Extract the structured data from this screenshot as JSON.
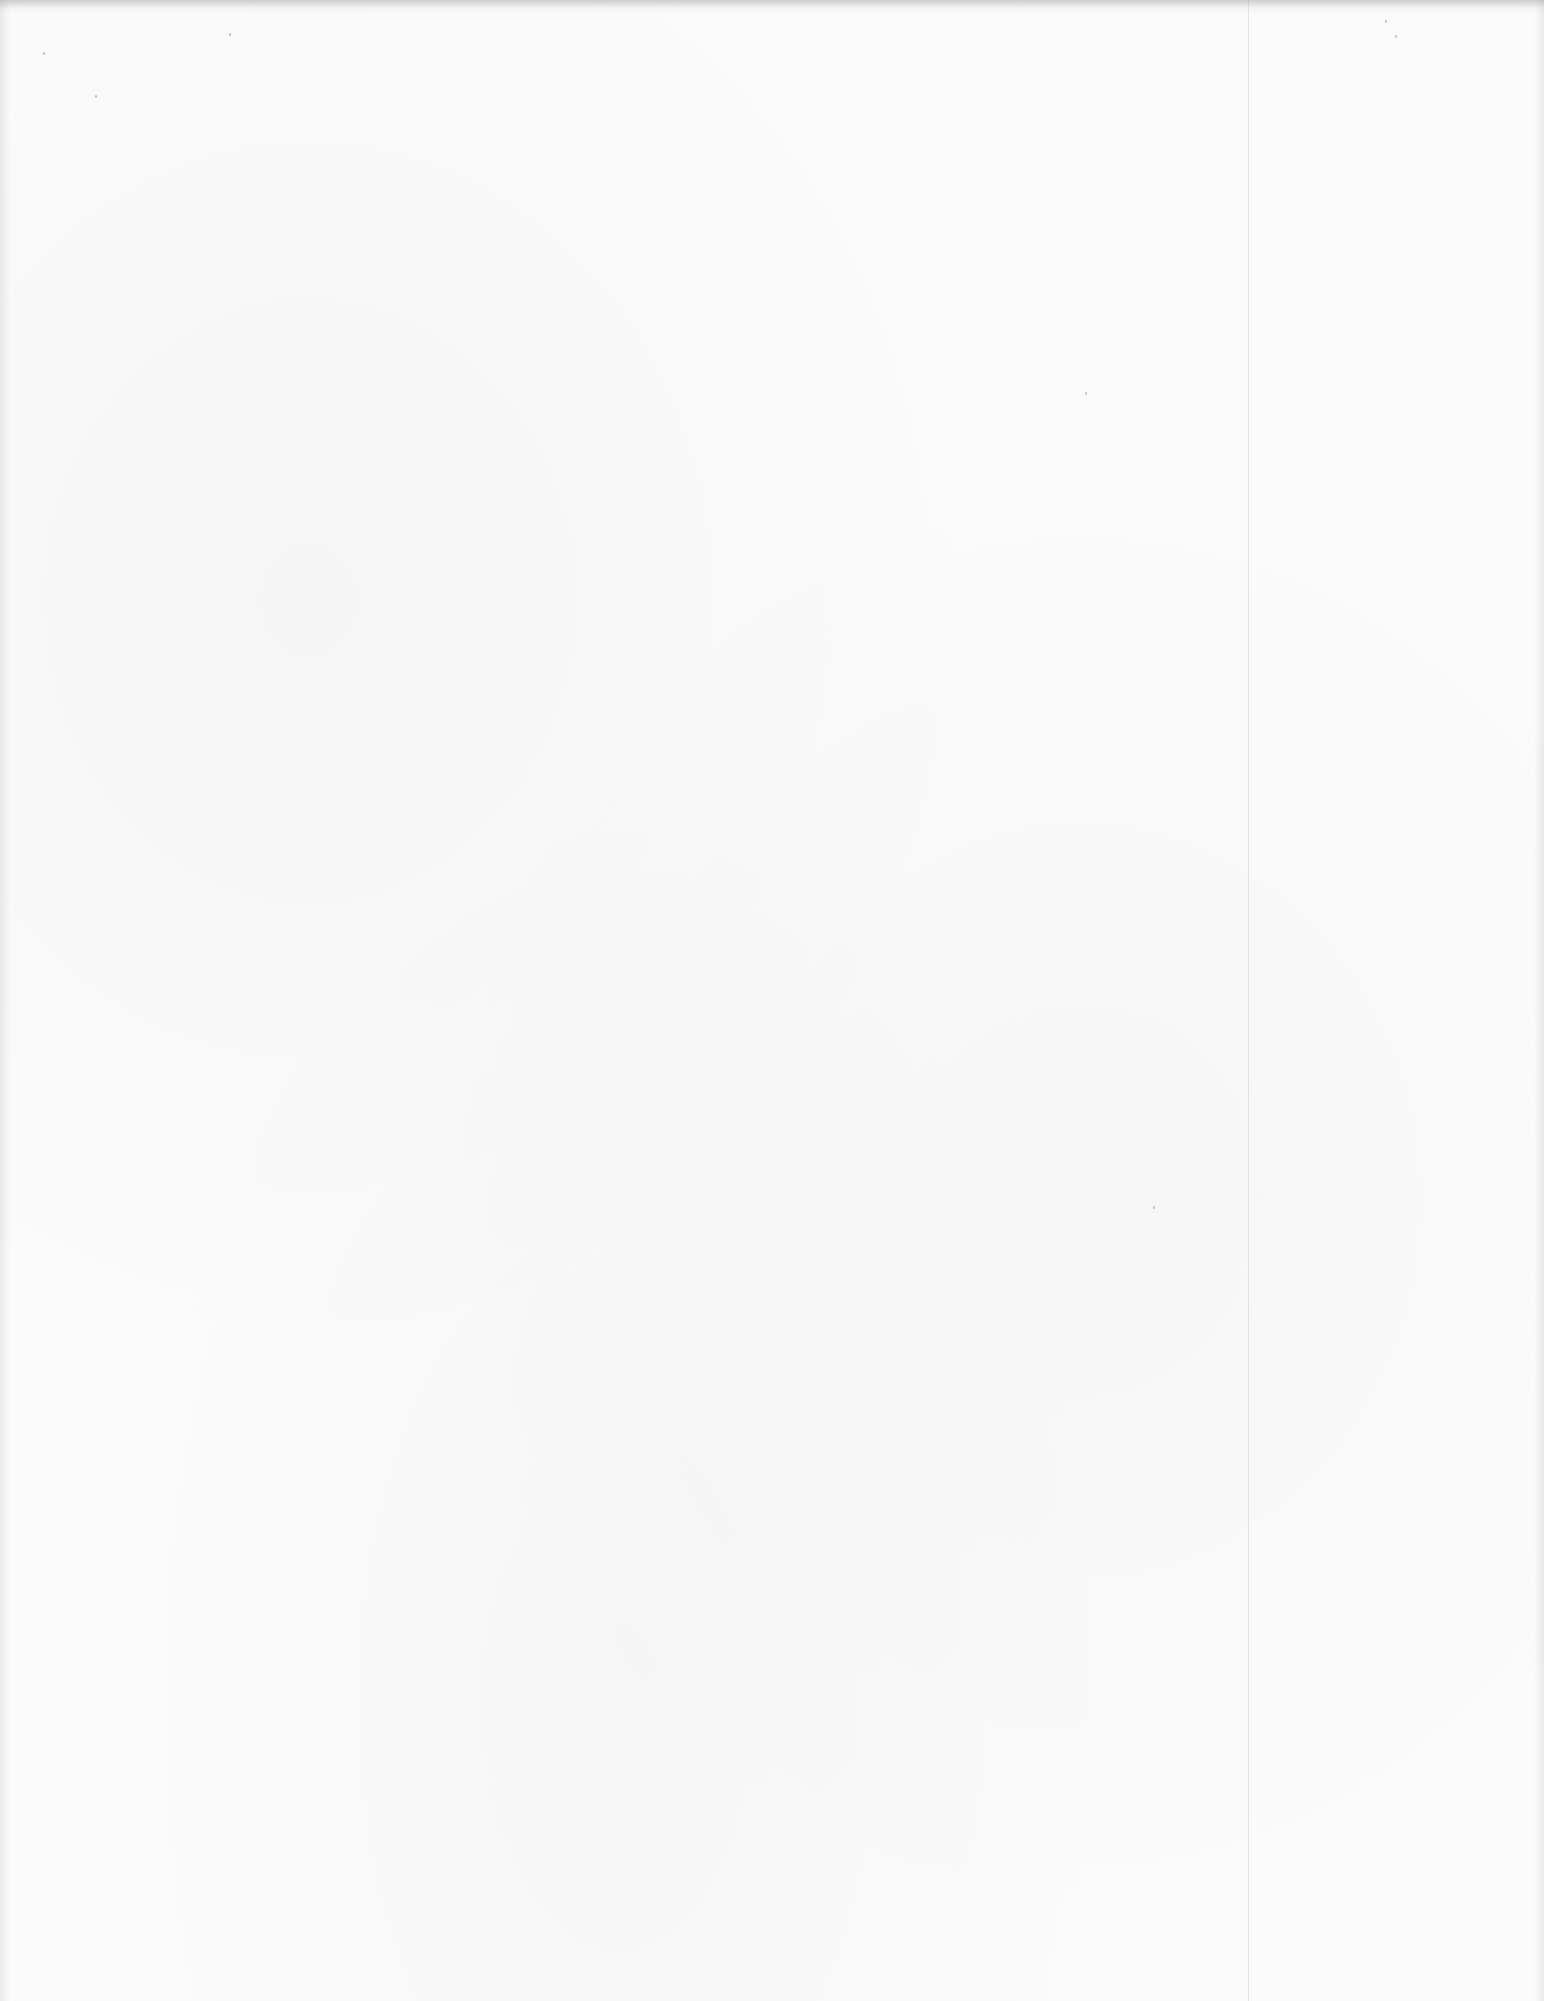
{
  "document": {
    "type": "scanned-page",
    "state": "blank",
    "text": ""
  },
  "colors": {
    "paper": "#fbfbfb",
    "edge_shadow": "#787878",
    "fold_line": "#a0a0a0"
  }
}
